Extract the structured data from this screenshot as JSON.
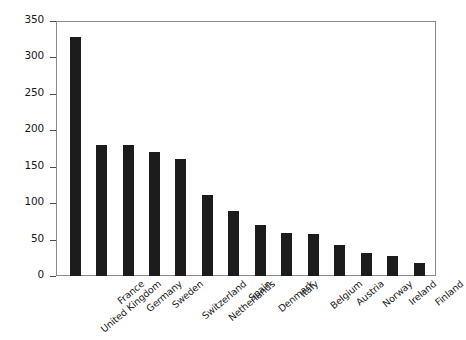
{
  "chart_data": {
    "type": "bar",
    "title": "",
    "xlabel": "",
    "ylabel": "Number of companies",
    "ylim": [
      0,
      350
    ],
    "yticks": [
      0,
      50,
      100,
      150,
      200,
      250,
      300,
      350
    ],
    "ytick_labels": [
      "0",
      "50",
      "100",
      "150",
      "200",
      "250",
      "300",
      "350"
    ],
    "grid": false,
    "legend": "none",
    "bar_color": "#1c1c1c",
    "categories": [
      "United Kingdom",
      "France",
      "Germany",
      "Sweden",
      "Switzerland",
      "Netherlands",
      "Spain",
      "Denmark",
      "Italy",
      "Belgium",
      "Austria",
      "Norway",
      "Ireland",
      "Finland"
    ],
    "values": [
      328,
      180,
      180,
      170,
      160,
      111,
      89,
      70,
      59,
      57,
      42,
      31,
      27,
      18
    ]
  }
}
